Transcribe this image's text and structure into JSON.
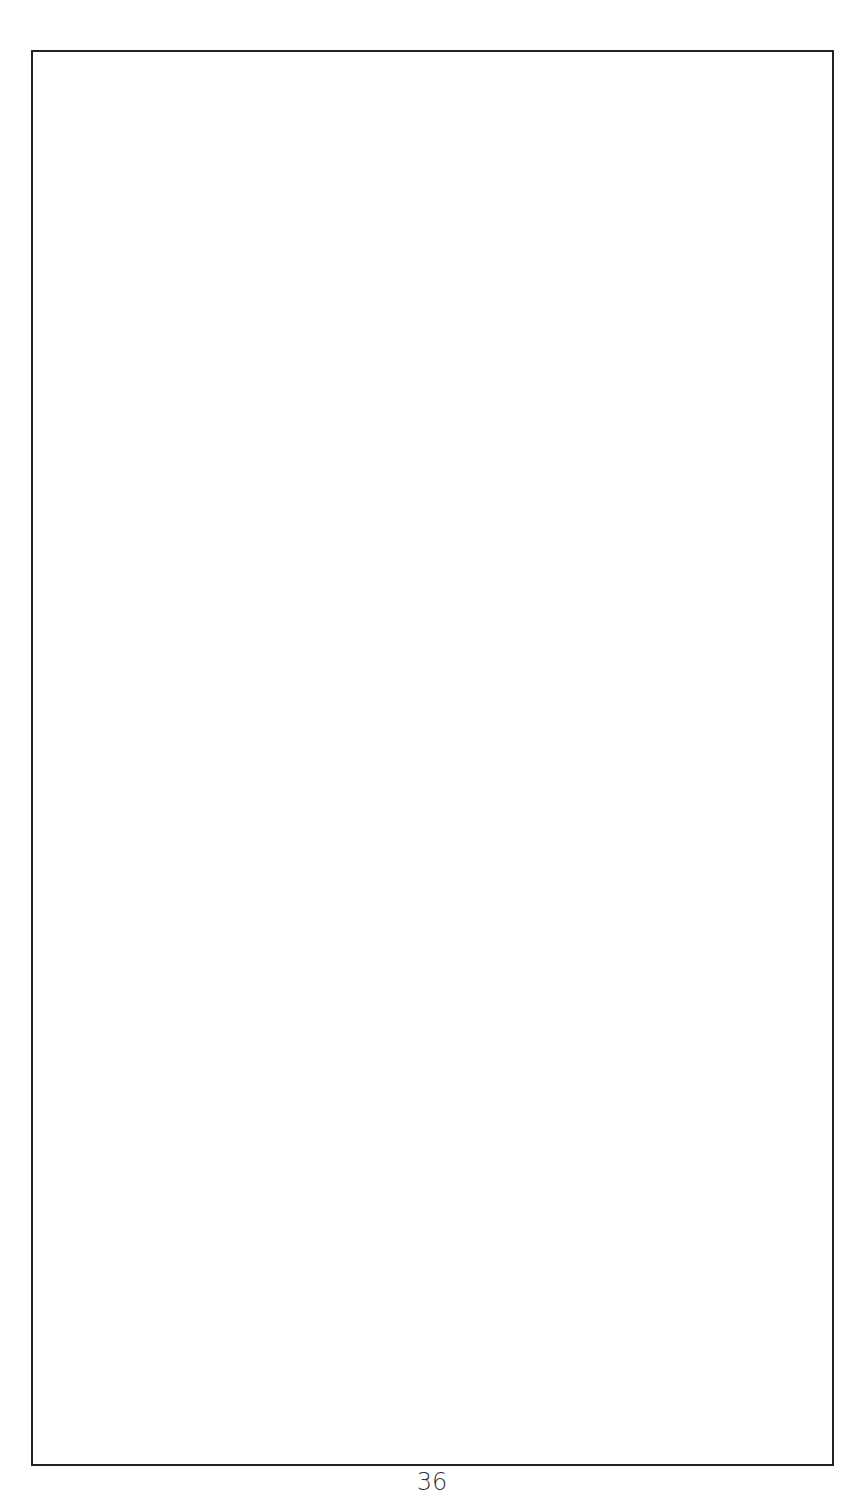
{
  "page": {
    "page_number": "36",
    "frame": {
      "content": ""
    }
  }
}
